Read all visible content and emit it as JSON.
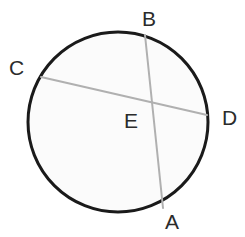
{
  "figure": {
    "kind": "circle-geometry-diagram",
    "canvas": {
      "width": 245,
      "height": 237
    },
    "colors": {
      "background": "#ffffff",
      "circle_stroke": "#1a1a1a",
      "circle_fill": "#fbfbfb",
      "chord_stroke": "#b0b0b0",
      "label_text": "#2b2b2b"
    },
    "circle": {
      "center_x": 118,
      "center_y": 122,
      "radius": 90,
      "stroke_width": 3
    },
    "chords": [
      {
        "name": "chord-AB",
        "from": "B",
        "to": "A",
        "x1": 145,
        "y1": 35,
        "x2": 163,
        "y2": 208,
        "stroke_width": 2
      },
      {
        "name": "chord-CD",
        "from": "C",
        "to": "D",
        "x1": 41,
        "y1": 77,
        "x2": 207,
        "y2": 115,
        "stroke_width": 2
      }
    ],
    "intersection": {
      "name": "E",
      "x": 152,
      "y": 105
    },
    "labels": [
      {
        "id": "B",
        "text": "B",
        "x": 142,
        "y": 8,
        "role": "chord-endpoint-top"
      },
      {
        "id": "C",
        "text": "C",
        "x": 9,
        "y": 57,
        "role": "chord-endpoint-left"
      },
      {
        "id": "D",
        "text": "D",
        "x": 222,
        "y": 107,
        "role": "chord-endpoint-right"
      },
      {
        "id": "E",
        "text": "E",
        "x": 124,
        "y": 110,
        "role": "intersection-point"
      },
      {
        "id": "A",
        "text": "A",
        "x": 165,
        "y": 211,
        "role": "chord-endpoint-bottom"
      }
    ]
  }
}
